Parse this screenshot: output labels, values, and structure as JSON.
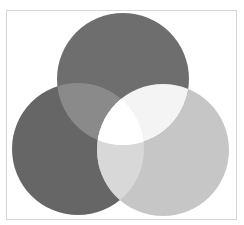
{
  "diagram": {
    "type": "venn",
    "sets": [
      {
        "id": "top",
        "cx": 123,
        "cy": 79,
        "r": 66,
        "color": "#6e6e6e"
      },
      {
        "id": "left",
        "cx": 78,
        "cy": 149,
        "r": 66,
        "color": "#666666"
      },
      {
        "id": "right",
        "cx": 163,
        "cy": 150,
        "r": 66,
        "color": "#c6c6c6"
      }
    ],
    "intersections": {
      "top_left": "#8a8a8a",
      "top_right": "#f4f4f4",
      "left_right": "#d8d8d8",
      "all": "#ffffff"
    },
    "frame": {
      "border_color": "#d6d6d6",
      "background": "#ffffff"
    },
    "labels": []
  }
}
